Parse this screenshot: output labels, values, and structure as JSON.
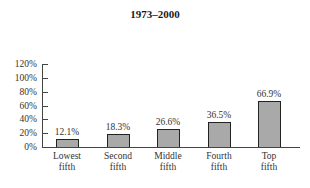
{
  "chart_data": {
    "type": "bar",
    "title": "1973–2000",
    "xlabel": "",
    "ylabel": "",
    "categories": [
      "Lowest fifth",
      "Second fifth",
      "Middle fifth",
      "Fourth fifth",
      "Top fifth"
    ],
    "category_lines": [
      [
        "Lowest",
        "fifth"
      ],
      [
        "Second",
        "fifth"
      ],
      [
        "Middle",
        "fifth"
      ],
      [
        "Fourth",
        "fifth"
      ],
      [
        "Top",
        "fifth"
      ]
    ],
    "values": [
      12.1,
      18.3,
      26.6,
      36.5,
      66.9
    ],
    "value_labels": [
      "12.1%",
      "18.3%",
      "26.6%",
      "36.5%",
      "66.9%"
    ],
    "ylim": [
      0,
      120
    ],
    "yticks": [
      0,
      20,
      40,
      60,
      80,
      100,
      120
    ],
    "ytick_labels": [
      "0%",
      "20%",
      "40%",
      "60%",
      "80%",
      "100%",
      "120%"
    ],
    "grid": false,
    "legend": null,
    "bar_color": "#a9a9a9",
    "bar_edge_color": "#222222"
  }
}
